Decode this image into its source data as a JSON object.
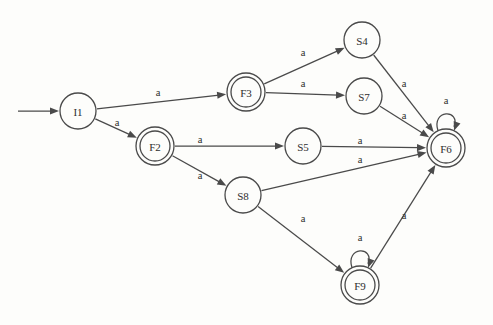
{
  "diagram": {
    "type": "finite-state-automaton",
    "background_color": "#fdfdfb",
    "stroke_color": "#4a4a4a",
    "text_color": "#2e2e2e",
    "start_marker": {
      "name": "start-arrow",
      "from_x": 18,
      "to_x": 58,
      "y": 111
    },
    "nodes": [
      {
        "id": "I1",
        "label": "I1",
        "x": 78,
        "y": 111,
        "radius": 18,
        "accepting": false,
        "initial": true
      },
      {
        "id": "F3",
        "label": "F3",
        "x": 246,
        "y": 92,
        "radius": 19,
        "accepting": true,
        "initial": false
      },
      {
        "id": "F2",
        "label": "F2",
        "x": 155,
        "y": 146,
        "radius": 19,
        "accepting": true,
        "initial": false
      },
      {
        "id": "S4",
        "label": "S4",
        "x": 362,
        "y": 40,
        "radius": 18,
        "accepting": false,
        "initial": false
      },
      {
        "id": "S7",
        "label": "S7",
        "x": 364,
        "y": 96,
        "radius": 18,
        "accepting": false,
        "initial": false
      },
      {
        "id": "S5",
        "label": "S5",
        "x": 303,
        "y": 146,
        "radius": 18,
        "accepting": false,
        "initial": false
      },
      {
        "id": "S8",
        "label": "S8",
        "x": 243,
        "y": 195,
        "radius": 18,
        "accepting": false,
        "initial": false
      },
      {
        "id": "F6",
        "label": "F6",
        "x": 446,
        "y": 148,
        "radius": 19,
        "accepting": true,
        "initial": false
      },
      {
        "id": "F9",
        "label": "F9",
        "x": 360,
        "y": 285,
        "radius": 19,
        "accepting": true,
        "initial": false
      }
    ],
    "edges": [
      {
        "from": "I1",
        "to": "F3",
        "label": "a",
        "label_x": 158,
        "label_y": 92,
        "kind": "line"
      },
      {
        "from": "I1",
        "to": "F2",
        "label": "a",
        "label_x": 117,
        "label_y": 122,
        "kind": "line"
      },
      {
        "from": "F3",
        "to": "S4",
        "label": "a",
        "label_x": 303,
        "label_y": 52,
        "kind": "line"
      },
      {
        "from": "F3",
        "to": "S7",
        "label": "a",
        "label_x": 303,
        "label_y": 83,
        "kind": "line"
      },
      {
        "from": "S4",
        "to": "F6",
        "label": "a",
        "label_x": 404,
        "label_y": 83,
        "kind": "line"
      },
      {
        "from": "S7",
        "to": "F6",
        "label": "a",
        "label_x": 404,
        "label_y": 115,
        "kind": "line"
      },
      {
        "from": "F2",
        "to": "S5",
        "label": "a",
        "label_x": 200,
        "label_y": 139,
        "kind": "line"
      },
      {
        "from": "F2",
        "to": "S8",
        "label": "a",
        "label_x": 200,
        "label_y": 175,
        "kind": "line"
      },
      {
        "from": "S5",
        "to": "F6",
        "label": "a",
        "label_x": 360,
        "label_y": 140,
        "kind": "line"
      },
      {
        "from": "S8",
        "to": "F6",
        "label": "a",
        "label_x": 360,
        "label_y": 159,
        "kind": "line"
      },
      {
        "from": "S8",
        "to": "F9",
        "label": "a",
        "label_x": 303,
        "label_y": 218,
        "kind": "line"
      },
      {
        "from": "F9",
        "to": "F6",
        "label": "a",
        "label_x": 404,
        "label_y": 215,
        "kind": "line"
      },
      {
        "from": "F6",
        "to": "F6",
        "label": "a",
        "label_x": 446,
        "label_y": 100,
        "kind": "self-loop"
      },
      {
        "from": "F9",
        "to": "F9",
        "label": "a",
        "label_x": 360,
        "label_y": 237,
        "kind": "self-loop"
      }
    ]
  }
}
